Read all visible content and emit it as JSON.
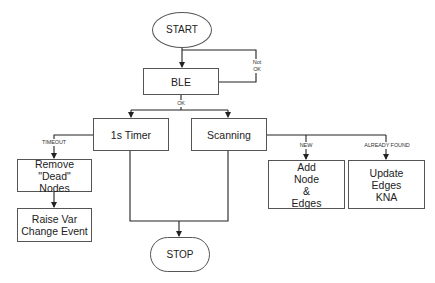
{
  "diagram": {
    "type": "flowchart",
    "nodes": {
      "start": "START",
      "ble": "BLE",
      "timer": "1s Timer",
      "scanning": "Scanning",
      "remove_dead": "Remove \"Dead\"\nNodes",
      "raise_var": "Raise Var\nChange Event",
      "add_node": "Add\nNode\n&\nEdges",
      "update_edges": "Update\nEdges\nKNA",
      "stop": "STOP"
    },
    "edge_labels": {
      "not_ok": "Not\nOK",
      "ok": "OK",
      "timeout": "TIMEOUT",
      "new": "NEW",
      "already_found": "ALREADY FOUND"
    },
    "edges": [
      {
        "from": "START",
        "to": "BLE"
      },
      {
        "from": "BLE",
        "to": "BLE",
        "label": "Not OK"
      },
      {
        "from": "BLE",
        "to": "1s Timer",
        "label": "OK"
      },
      {
        "from": "BLE",
        "to": "Scanning",
        "label": "OK"
      },
      {
        "from": "1s Timer",
        "to": "Remove \"Dead\" Nodes",
        "label": "TIMEOUT"
      },
      {
        "from": "Remove \"Dead\" Nodes",
        "to": "Raise Var Change Event"
      },
      {
        "from": "Scanning",
        "to": "Add Node & Edges",
        "label": "NEW"
      },
      {
        "from": "Scanning",
        "to": "Update Edges KNA",
        "label": "ALREADY FOUND"
      },
      {
        "from": "1s Timer",
        "to": "STOP"
      },
      {
        "from": "Scanning",
        "to": "STOP"
      }
    ],
    "colors": {
      "line": "#222222",
      "border": "#555555",
      "background": "#ffffff"
    }
  }
}
